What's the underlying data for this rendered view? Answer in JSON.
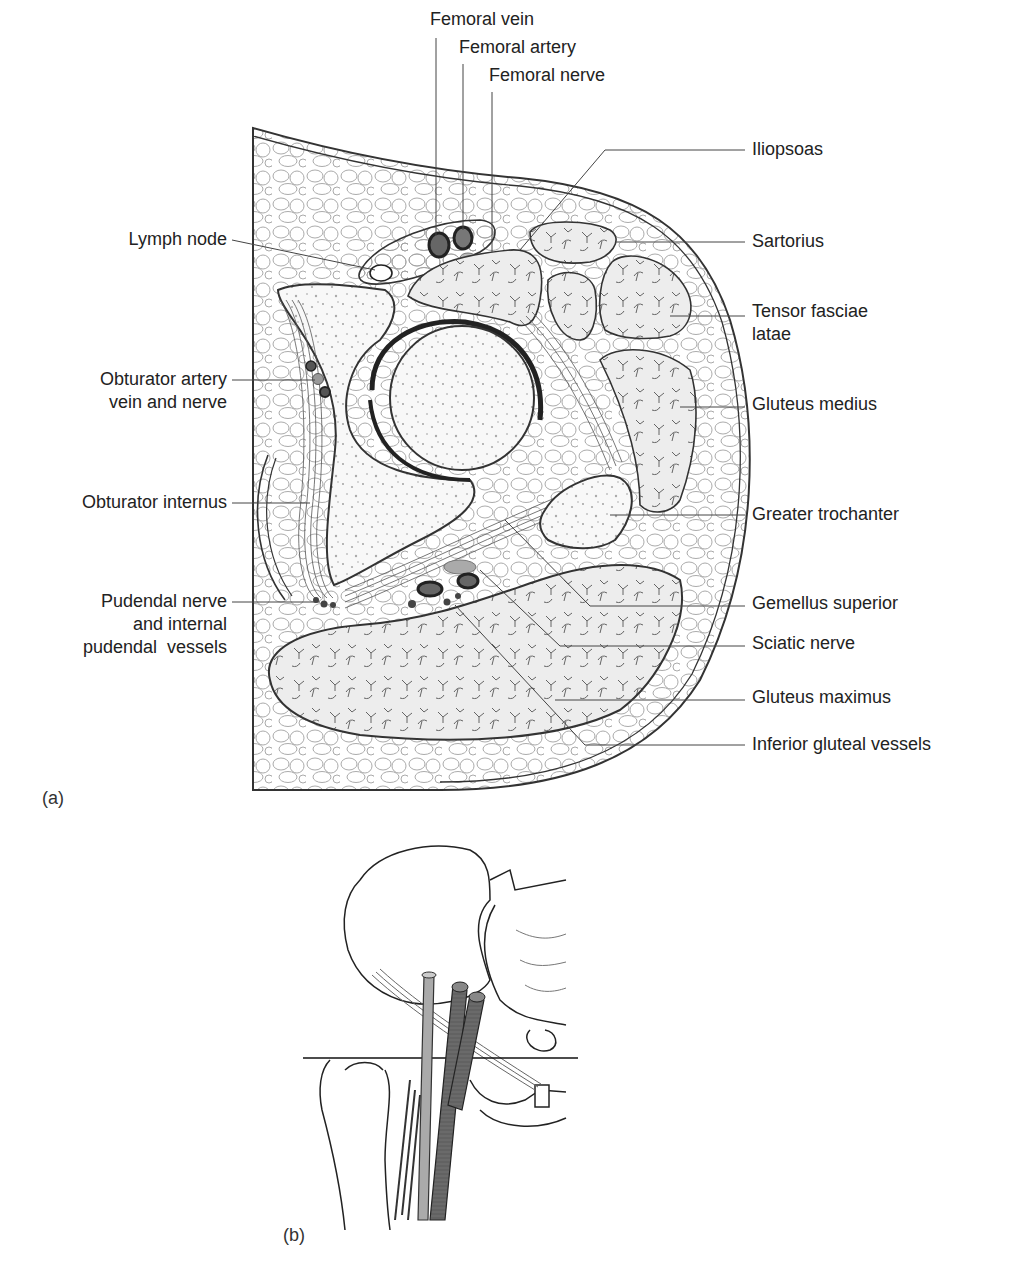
{
  "figure": {
    "panel_a": {
      "letter": "(a)",
      "title": "Transverse section through the hip joint",
      "labels_top": [
        {
          "id": "femoral-vein",
          "text": "Femoral vein"
        },
        {
          "id": "femoral-artery",
          "text": "Femoral artery"
        },
        {
          "id": "femoral-nerve",
          "text": "Femoral nerve"
        }
      ],
      "labels_left": [
        {
          "id": "lymph-node",
          "text": "Lymph node"
        },
        {
          "id": "obturator-artery",
          "line1": "Obturator artery",
          "line2": "vein and nerve"
        },
        {
          "id": "obturator-internus",
          "text": "Obturator internus"
        },
        {
          "id": "pudendal",
          "line1": "Pudendal nerve",
          "line2": "and internal",
          "line3": "pudendal  vessels"
        }
      ],
      "labels_right": [
        {
          "id": "iliopsoas",
          "text": "Iliopsoas"
        },
        {
          "id": "sartorius",
          "text": "Sartorius"
        },
        {
          "id": "tensor-fasciae-latae",
          "line1": "Tensor fasciae",
          "line2": "latae"
        },
        {
          "id": "gluteus-medius",
          "text": "Gluteus medius"
        },
        {
          "id": "greater-trochanter",
          "text": "Greater trochanter"
        },
        {
          "id": "gemellus-superior",
          "text": "Gemellus superior"
        },
        {
          "id": "sciatic-nerve",
          "text": "Sciatic nerve"
        },
        {
          "id": "gluteus-maximus",
          "text": "Gluteus maximus"
        },
        {
          "id": "inferior-gluteal-vessels",
          "text": "Inferior gluteal vessels"
        }
      ]
    },
    "panel_b": {
      "letter": "(b)",
      "title": "Level of section through pelvis and femur"
    }
  },
  "colors": {
    "line": "#333333",
    "fat_stroke": "#9a9a9a",
    "muscle_fill": "#ececec",
    "bone_fill": "#f7f7f7",
    "vessel_dark": "#555555",
    "vessel_mid": "#8a8a8a",
    "vessel_light": "#b5b5b5"
  }
}
